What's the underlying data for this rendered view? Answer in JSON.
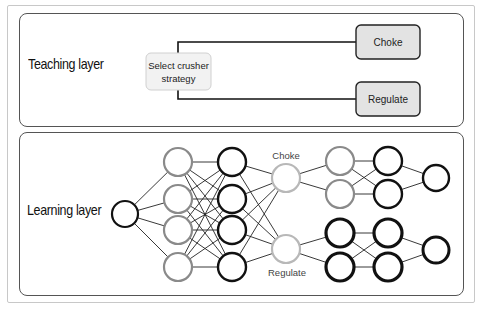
{
  "teaching_layer": {
    "label": "Teaching layer",
    "selector_node": {
      "line1": "Select crusher",
      "line2": "strategy"
    },
    "options": [
      {
        "label": "Choke"
      },
      {
        "label": "Regulate"
      }
    ]
  },
  "learning_layer": {
    "label": "Learning layer",
    "branch_labels": {
      "top": "Choke",
      "bottom": "Regulate"
    },
    "network": {
      "input_nodes": 1,
      "hidden_layer_1_nodes": 4,
      "hidden_layer_2_nodes": 4,
      "strategy_nodes": 2,
      "choke_branch": {
        "layer_a_nodes": 2,
        "layer_b_nodes": 2,
        "output_nodes": 1
      },
      "regulate_branch": {
        "layer_a_nodes": 2,
        "layer_b_nodes": 2,
        "output_nodes": 1
      }
    }
  },
  "colors": {
    "panel_border": "#555555",
    "outer_frame": "#c8c8c8",
    "node_black": "#111111",
    "node_gray": "#8a8a8a",
    "node_lightgray": "#b8b8b8",
    "box_fill_gray": "#e3e3e3",
    "box_fill_light": "#f2f2f2",
    "edge": "#222222"
  }
}
